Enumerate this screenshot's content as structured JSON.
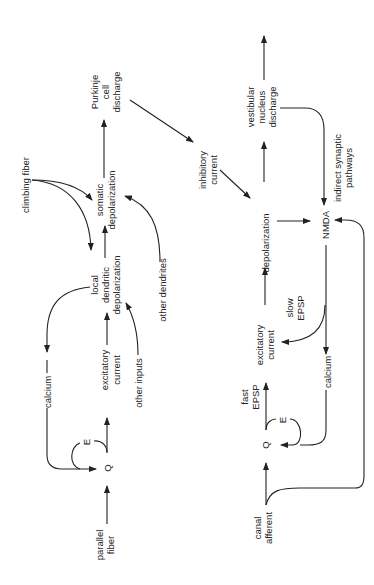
{
  "diagram": {
    "orientation": "rotated 90deg counter-clockwise",
    "cerebellar_pathway": {
      "parallel_fiber": [
        "parallel",
        "fiber"
      ],
      "q": "Q",
      "e": "E",
      "excitatory_current": [
        "excitatory",
        "current"
      ],
      "calcium": "calcium",
      "local_dendritic_depolarization": [
        "local",
        "dendritic",
        "depolarization"
      ],
      "other_inputs": "other inputs",
      "climbing_fiber": "climbing fiber",
      "somatic_depolarization": [
        "somatic",
        "depolarization"
      ],
      "other_dendrites": "other dendrites",
      "purkinje_cell_discharge": [
        "Purkinje",
        "cell",
        "discharge"
      ]
    },
    "inhibitory_current": [
      "inhibitory",
      "current"
    ],
    "vestibular_pathway": {
      "canal_afferent": [
        "canal",
        "afferent"
      ],
      "q": "Q",
      "e": "E",
      "fast_epsp": [
        "fast",
        "EPSP"
      ],
      "excitatory_current": [
        "excitatory",
        "current"
      ],
      "slow_epsp": [
        "slow",
        "EPSP"
      ],
      "calcium": "calcium",
      "depolarization": "depolarization",
      "nmda": "NMDA",
      "indirect_synaptic_pathways": [
        "indirect synaptic",
        "pathways"
      ],
      "vestibular_nucleus_discharge": [
        "vestibular",
        "nucleus",
        "discharge"
      ]
    }
  }
}
